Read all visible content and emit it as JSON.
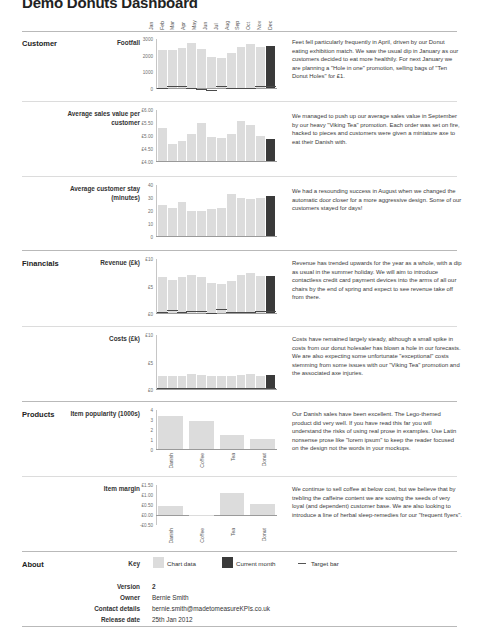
{
  "header": {
    "title": "Demo Donuts Dashboard",
    "months": [
      "Jan",
      "Feb",
      "Mar",
      "Apr",
      "May",
      "Jun",
      "Jul",
      "Aug",
      "Sep",
      "Oct",
      "Nov",
      "Dec"
    ]
  },
  "sections": [
    {
      "name": "Customer"
    },
    {
      "name": "Financials"
    },
    {
      "name": "Products"
    },
    {
      "name": "About"
    }
  ],
  "rows": [
    {
      "label": "Footfall",
      "note": "Feet fell particularly frequently in April, driven by our Donut eating exhibition match. We saw the usual dip in January as our customers decided to eat more healthily. For next January we are planning a \"Hole in one\" promotion, selling bags of \"Ten Donut Holes\" for £1."
    },
    {
      "label": "Average sales value per customer",
      "note": "We managed to push up our average sales value in September by our heavy \"Viking Tea\" promotion. Each order was set on fire, hacked to pieces and customers were given a miniature axe to eat their Danish with."
    },
    {
      "label": "Average customer stay (minutes)",
      "note": "We had a resounding success in August when we changed the automatic door closer for a more aggressive design. Some of our customers stayed for days!"
    },
    {
      "label": "Revenue (£k)",
      "note": "Revenue has trended upwards for the year as a whole, with a dip as usual in the summer holiday. We will aim to introduce contactless credit card payment devices into the arms of all our chairs by the end of spring and expect to see revenue take off from there."
    },
    {
      "label": "Costs (£k)",
      "note": "Costs have remained largely steady, although a small spike in costs from our donut holesaler has blown a hole in our forecasts. We are also expecting some unfortunate \"exceptional\" costs stemming from some issues with our \"Viking Tea\" promotion and the associated axe injuries."
    },
    {
      "label": "Item popularity (1000s)",
      "note": "Our Danish sales have been excellent. The Lego-themed product did very well. If you have read this far you will understand the risks of using real prose in examples. Use Latin nonsense prose like \"lorem ipsum\" to keep the reader focused on the design not the words in your mockups."
    },
    {
      "label": "Item margin",
      "note": "We continue to sell coffee at below cost, but we believe that by trebling the caffeine content we are sowing the seeds of very loyal (and dependent) customer base. We are also looking to introduce a line of herbal sleep-remedies for our \"frequent flyers\"."
    }
  ],
  "about": {
    "section_label": "About",
    "key_label": "Key",
    "legend": [
      {
        "name": "chart-data",
        "label": "Chart data",
        "color": "#dcdcdc"
      },
      {
        "name": "current-month",
        "label": "Current month",
        "color": "#3a3a3a"
      },
      {
        "name": "target-bar",
        "label": "Target bar",
        "color": "#555555"
      }
    ],
    "fields": [
      {
        "label": "Version",
        "value": "2",
        "bold": true
      },
      {
        "label": "Owner",
        "value": "Bernie Smith",
        "bold": false
      },
      {
        "label": "Contact details",
        "value": "bernie.smith@madetomeasureKPIs.co.uk",
        "bold": false
      },
      {
        "label": "Release date",
        "value": "25th Jan 2012",
        "bold": false
      }
    ]
  },
  "colors": {
    "bar": "#dcdcdc",
    "current": "#3a3a3a",
    "target": "#4a4a4a",
    "axis": "#9a9a9a",
    "text": "#333333"
  },
  "chart_data": [
    {
      "id": "footfall",
      "type": "bar",
      "title": "Footfall",
      "xlabel": "",
      "ylabel": "",
      "categories": [
        "Jan",
        "Feb",
        "Mar",
        "Apr",
        "May",
        "Jun",
        "Jul",
        "Aug",
        "Sep",
        "Oct",
        "Nov",
        "Dec"
      ],
      "values": [
        2300,
        2350,
        2450,
        2750,
        2400,
        1900,
        1850,
        2150,
        2500,
        2700,
        2500,
        2550
      ],
      "targets": [
        2250,
        2400,
        2500,
        2700,
        2250,
        1700,
        1900,
        2100,
        2450,
        2650,
        2550,
        2600
      ],
      "current_month_index": 11,
      "ylim": [
        0,
        3000
      ],
      "yticks": [
        0,
        1000,
        2000,
        3000
      ],
      "yticklabels": [
        "0",
        "1000",
        "2000",
        "3000"
      ],
      "grid": false,
      "legend": "none"
    },
    {
      "id": "average-sales-value-per-customer",
      "type": "bar",
      "title": "Average sales value per customer",
      "xlabel": "",
      "ylabel": "",
      "categories": [
        "Jan",
        "Feb",
        "Mar",
        "Apr",
        "May",
        "Jun",
        "Jul",
        "Aug",
        "Sep",
        "Oct",
        "Nov",
        "Dec"
      ],
      "values": [
        5.3,
        4.65,
        4.8,
        5.05,
        5.5,
        4.95,
        4.9,
        5.05,
        5.55,
        5.4,
        5.0,
        4.85
      ],
      "targets": [],
      "current_month_index": 11,
      "ylim": [
        4.0,
        6.0
      ],
      "yticks": [
        4.0,
        4.5,
        5.0,
        5.5,
        6.0
      ],
      "yticklabels": [
        "£4.00",
        "£4.50",
        "£5.00",
        "£5.50",
        "£6.00"
      ],
      "grid": false,
      "legend": "none"
    },
    {
      "id": "average-customer-stay-minutes",
      "type": "bar",
      "title": "Average customer stay (minutes)",
      "xlabel": "",
      "ylabel": "",
      "categories": [
        "Jan",
        "Feb",
        "Mar",
        "Apr",
        "May",
        "Jun",
        "Jul",
        "Aug",
        "Sep",
        "Oct",
        "Nov",
        "Dec"
      ],
      "values": [
        24,
        22,
        27,
        20,
        20,
        21,
        22,
        33,
        30,
        29,
        30,
        31
      ],
      "targets": [],
      "current_month_index": 11,
      "ylim": [
        0,
        40
      ],
      "yticks": [
        0,
        10,
        20,
        30,
        40
      ],
      "yticklabels": [
        "0",
        "10",
        "20",
        "30",
        "40"
      ],
      "grid": false,
      "legend": "none"
    },
    {
      "id": "revenue",
      "type": "bar",
      "title": "Revenue (£k)",
      "xlabel": "",
      "ylabel": "",
      "categories": [
        "Jan",
        "Feb",
        "Mar",
        "Apr",
        "May",
        "Jun",
        "Jul",
        "Aug",
        "Sep",
        "Oct",
        "Nov",
        "Dec"
      ],
      "values": [
        6.6,
        6.2,
        6.6,
        7.0,
        6.6,
        5.6,
        5.3,
        5.9,
        7.0,
        7.4,
        6.8,
        6.8
      ],
      "targets": [
        6.6,
        6.6,
        6.6,
        7.1,
        6.7,
        5.4,
        5.8,
        5.9,
        7.0,
        7.4,
        6.9,
        6.9
      ],
      "current_month_index": 11,
      "ylim": [
        0,
        10
      ],
      "yticks": [
        0,
        5,
        10
      ],
      "yticklabels": [
        "£0",
        "£5",
        "£10"
      ],
      "grid": false,
      "legend": "none"
    },
    {
      "id": "costs",
      "type": "bar",
      "title": "Costs (£k)",
      "xlabel": "",
      "ylabel": "",
      "categories": [
        "Jan",
        "Feb",
        "Mar",
        "Apr",
        "May",
        "Jun",
        "Jul",
        "Aug",
        "Sep",
        "Oct",
        "Nov",
        "Dec"
      ],
      "values": [
        2.5,
        2.4,
        2.5,
        2.7,
        2.6,
        2.4,
        2.5,
        2.5,
        2.6,
        2.8,
        2.5,
        2.6
      ],
      "targets": [
        2.5,
        2.4,
        2.5,
        2.7,
        2.6,
        2.4,
        2.5,
        2.5,
        2.6,
        2.8,
        2.5,
        2.6
      ],
      "current_month_index": 11,
      "ylim": [
        0,
        10
      ],
      "yticks": [
        0,
        5,
        10
      ],
      "yticklabels": [
        "£0",
        "£5",
        "£10"
      ],
      "grid": false,
      "legend": "none"
    },
    {
      "id": "item-popularity",
      "type": "bar",
      "title": "Item popularity (1000s)",
      "xlabel": "",
      "ylabel": "",
      "categories": [
        "Danish",
        "Coffee",
        "Tea",
        "Donut"
      ],
      "values": [
        3.4,
        2.9,
        1.4,
        1.0
      ],
      "targets": [],
      "current_month_index": -1,
      "ylim": [
        0,
        4
      ],
      "yticks": [
        0,
        1,
        2,
        3,
        4
      ],
      "yticklabels": [
        "0",
        "1",
        "2",
        "3",
        "4"
      ],
      "grid": false,
      "legend": "none"
    },
    {
      "id": "item-margin",
      "type": "bar",
      "title": "Item margin",
      "xlabel": "",
      "ylabel": "",
      "categories": [
        "Danish",
        "Coffee",
        "Tea",
        "Donut"
      ],
      "values": [
        0.45,
        -0.03,
        1.1,
        0.55
      ],
      "targets": [],
      "current_month_index": -1,
      "ylim": [
        -0.5,
        1.5
      ],
      "yticks": [
        -0.5,
        0.0,
        0.5,
        1.0,
        1.5
      ],
      "yticklabels": [
        "-£0.50",
        "£0.00",
        "£0.50",
        "£1.00",
        "£1.50"
      ],
      "grid": false,
      "legend": "none"
    }
  ]
}
